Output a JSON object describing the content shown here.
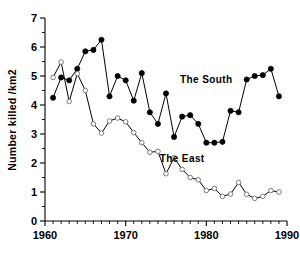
{
  "chart_data": {
    "type": "line",
    "title": "",
    "xlabel": "",
    "ylabel": "Number killed /km2",
    "xlim": [
      1960,
      1990
    ],
    "ylim": [
      0,
      7
    ],
    "xticks": [
      1960,
      1970,
      1980,
      1990
    ],
    "xtick_labels": [
      "1960",
      "1970",
      "1980",
      "1990"
    ],
    "yticks": [
      0,
      1,
      2,
      3,
      4,
      5,
      6,
      7
    ],
    "ytick_labels": [
      "0",
      "1",
      "2",
      "3",
      "4",
      "5",
      "6",
      "7"
    ],
    "minor_xtick_interval": 1,
    "minor_ytick_interval": 0.5,
    "grid": false,
    "legend": "inline-annotations",
    "x": [
      1961,
      1962,
      1963,
      1964,
      1965,
      1966,
      1967,
      1968,
      1969,
      1970,
      1971,
      1972,
      1973,
      1974,
      1975,
      1976,
      1977,
      1978,
      1979,
      1980,
      1981,
      1982,
      1983,
      1984,
      1985,
      1986,
      1987,
      1988,
      1989
    ],
    "series": [
      {
        "name": "The South",
        "marker": "filled-circle",
        "color": "#000000",
        "values": [
          4.25,
          4.95,
          4.85,
          5.25,
          5.85,
          5.9,
          6.25,
          4.3,
          5.0,
          4.85,
          4.15,
          5.1,
          3.75,
          3.35,
          4.4,
          2.9,
          3.6,
          3.65,
          3.35,
          2.7,
          2.7,
          2.73,
          3.8,
          3.75,
          4.88,
          5.0,
          5.03,
          5.25,
          4.3
        ]
      },
      {
        "name": "The East",
        "marker": "open-circle",
        "color": "#6f6f6f",
        "values": [
          4.95,
          5.48,
          4.12,
          5.08,
          4.5,
          3.35,
          3.03,
          3.45,
          3.55,
          3.42,
          3.05,
          2.7,
          2.37,
          2.4,
          1.63,
          2.18,
          1.78,
          1.5,
          1.42,
          1.05,
          1.12,
          0.85,
          0.93,
          1.33,
          0.92,
          0.78,
          0.85,
          1.05,
          1.0
        ]
      }
    ],
    "annotations": [
      {
        "text": "The South",
        "x": 1980.0,
        "y": 4.75
      },
      {
        "text": "The East",
        "x": 1977.0,
        "y": 2.05
      }
    ]
  }
}
